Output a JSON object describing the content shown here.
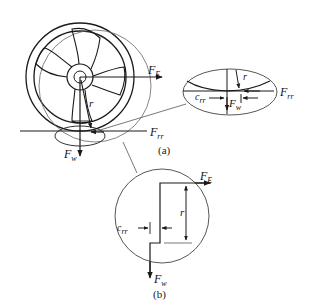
{
  "figure": {
    "type": "wheel rolling resistance free-body diagram",
    "colors": {
      "line": "#1a1a1a",
      "thin_line": "#555555",
      "background": "#ffffff"
    }
  },
  "labels": {
    "fe_main": {
      "base": "F",
      "sub": "E"
    },
    "frr_main": {
      "base": "F",
      "sub": "rr"
    },
    "fw_main": {
      "base": "F",
      "sub": "w"
    },
    "r_main": "r",
    "r_inset_a": "r",
    "frr_inset_a": {
      "base": "F",
      "sub": "rr"
    },
    "crr_inset_a": {
      "base": "c",
      "sub": "rr"
    },
    "fw_inset_a": {
      "base": "F",
      "sub": "w"
    },
    "fe_inset_b": {
      "base": "F",
      "sub": "E"
    },
    "r_inset_b": "r",
    "crr_inset_b": {
      "base": "c",
      "sub": "rr"
    },
    "fw_inset_b": {
      "base": "F",
      "sub": "w"
    }
  },
  "captions": {
    "a": "(a)",
    "b": "(b)"
  }
}
